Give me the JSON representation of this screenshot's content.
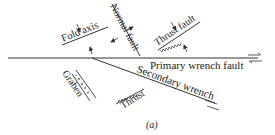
{
  "diagram": {
    "type": "strain-ellipse wrench fault structures",
    "caption": "(a)",
    "line_color": "#333333",
    "labels": {
      "fold_axis": "Fold axis",
      "normal_fault": "Normal fault",
      "thrust_fault": "Thrust fault",
      "primary_wrench_fault": "Primary wrench fault",
      "secondary_wrench": "Secondary wrench",
      "graben": "Graben",
      "thrust": "Thrust"
    }
  }
}
